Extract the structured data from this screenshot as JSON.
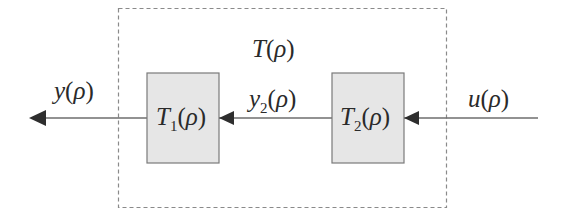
{
  "diagram": {
    "type": "block-diagram",
    "system": {
      "label": "T",
      "arg": "ρ"
    },
    "blocks": [
      {
        "id": "T1",
        "base": "T",
        "sub": "1",
        "arg": "ρ"
      },
      {
        "id": "T2",
        "base": "T",
        "sub": "2",
        "arg": "ρ"
      }
    ],
    "signals": {
      "output": {
        "base": "y",
        "arg": "ρ"
      },
      "intermediate": {
        "base": "y",
        "sub": "2",
        "arg": "ρ"
      },
      "input": {
        "base": "u",
        "arg": "ρ"
      }
    },
    "colors": {
      "block_fill": "#e6e6e6",
      "block_stroke": "#7a7a7a",
      "line": "#6e6e6e",
      "arrow": "#2e2e2e",
      "dashed_border": "#8a8a8a",
      "text": "#2a2a2a"
    }
  }
}
